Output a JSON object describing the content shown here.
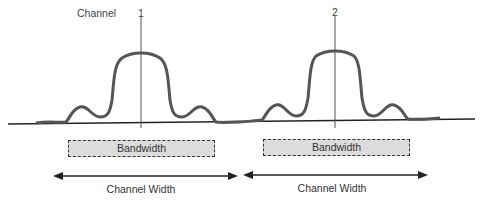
{
  "diagram": {
    "title_label": "Channel",
    "channels": [
      {
        "number": "1",
        "bandwidth_label": "Bandwidth",
        "width_label": "Channel Width"
      },
      {
        "number": "2",
        "bandwidth_label": "Bandwidth",
        "width_label": "Channel Width"
      }
    ],
    "colors": {
      "signal_curve": "#555555",
      "baseline": "#222222",
      "bandwidth_fill": "#dcdcdc"
    }
  }
}
